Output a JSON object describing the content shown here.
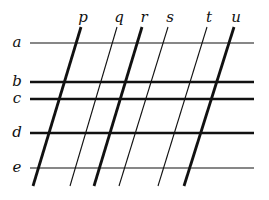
{
  "diagram": {
    "horizontal_lines": [
      {
        "label": "a",
        "y": 43,
        "thick": false
      },
      {
        "label": "b",
        "y": 82,
        "thick": true
      },
      {
        "label": "c",
        "y": 99,
        "thick": true
      },
      {
        "label": "d",
        "y": 133,
        "thick": true
      },
      {
        "label": "e",
        "y": 168,
        "thick": false
      }
    ],
    "slanted_lines": [
      {
        "label": "p",
        "x_top": 81,
        "x_bottom": 33,
        "thick": true
      },
      {
        "label": "q",
        "x_top": 117,
        "x_bottom": 70,
        "thick": false
      },
      {
        "label": "r",
        "x_top": 142,
        "x_bottom": 94,
        "thick": true
      },
      {
        "label": "s",
        "x_top": 168,
        "x_bottom": 119,
        "thick": false
      },
      {
        "label": "t",
        "x_top": 207,
        "x_bottom": 158,
        "thick": false
      },
      {
        "label": "u",
        "x_top": 234,
        "x_bottom": 184,
        "thick": true
      }
    ],
    "colors": {
      "line": "#111111",
      "background": "#ffffff"
    }
  }
}
